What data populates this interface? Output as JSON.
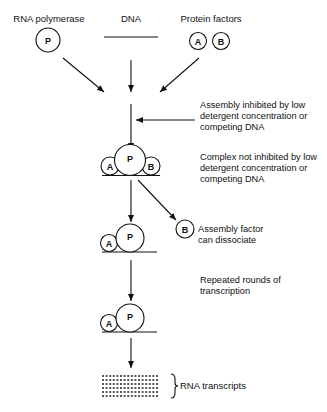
{
  "inputs": {
    "rna_polymerase": {
      "label": "RNA polymerase",
      "symbol": "P"
    },
    "dna": {
      "label": "DNA"
    },
    "protein_factors": {
      "label": "Protein factors",
      "symbols": [
        "A",
        "B"
      ]
    }
  },
  "steps": [
    {
      "id": "assembly",
      "note_lines": [
        "Assembly inhibited by low",
        "detergent concentration or",
        "competing DNA"
      ]
    },
    {
      "id": "complex",
      "symbols": [
        "A",
        "P",
        "B"
      ],
      "note_lines": [
        "Complex not inhibited by low",
        "detergent concentration or",
        "competing DNA"
      ]
    },
    {
      "id": "dissociation",
      "symbol": "B",
      "note_lines": [
        "Assembly factor",
        "can dissociate"
      ]
    },
    {
      "id": "complex_after_dissociation",
      "symbols": [
        "A",
        "P"
      ]
    },
    {
      "id": "transcription",
      "note_lines": [
        "Repeated rounds of",
        "transcription"
      ]
    },
    {
      "id": "complex_repeated",
      "symbols": [
        "A",
        "P"
      ]
    },
    {
      "id": "output",
      "label": "RNA transcripts"
    }
  ],
  "colors": {
    "ink": "#111111",
    "background": "#ffffff"
  }
}
